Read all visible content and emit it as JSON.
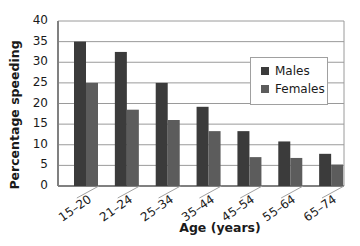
{
  "chart_data": {
    "type": "bar",
    "title": "",
    "xlabel": "Age (years)",
    "ylabel": "Percentage speeding",
    "ylim": [
      0,
      40
    ],
    "yticks": [
      0,
      5,
      10,
      15,
      20,
      25,
      30,
      35,
      40
    ],
    "grid": true,
    "legend_position": "upper right (inside)",
    "categories": [
      "15–20",
      "21–24",
      "25–34",
      "35–44",
      "45–54",
      "55–64",
      "65–74"
    ],
    "series": [
      {
        "name": "Males",
        "color": "#3b3b3b",
        "values": [
          35,
          32.5,
          25,
          19.2,
          13.3,
          10.8,
          7.8
        ]
      },
      {
        "name": "Females",
        "color": "#5c5c5c",
        "values": [
          25,
          18.5,
          16,
          13.3,
          7,
          6.8,
          5.2
        ]
      }
    ]
  },
  "style": {
    "grid_color": "#9a9a9a",
    "axis_color": "#808080",
    "floor_color": "#a0a0a0"
  }
}
